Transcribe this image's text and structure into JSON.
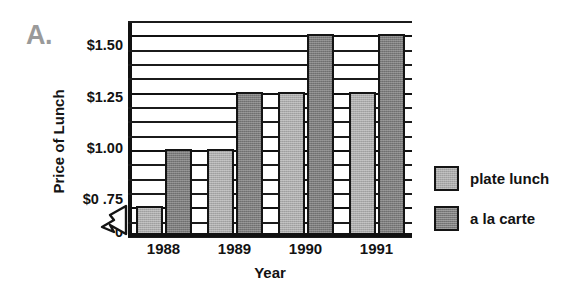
{
  "panel": {
    "letter": "A."
  },
  "chart_data": {
    "type": "bar",
    "title": "",
    "xlabel": "Year",
    "ylabel": "Price of Lunch",
    "categories": [
      "1988",
      "1989",
      "1990",
      "1991"
    ],
    "series": [
      {
        "name": "plate lunch",
        "color": "#ababab",
        "values": [
          0.75,
          1.0,
          1.25,
          1.25
        ]
      },
      {
        "name": "a la carte",
        "color": "#7c7c7c",
        "values": [
          1.0,
          1.25,
          1.5,
          1.5
        ]
      }
    ],
    "ytick_labels": [
      "$1.50",
      "$1.25",
      "$1.00",
      "$0 .75",
      "0"
    ],
    "ytick_values": [
      1.5,
      1.25,
      1.0,
      0.75,
      0
    ],
    "ylim": [
      0.625,
      1.5625
    ],
    "grid": true,
    "axis_break": true,
    "legend_position": "right"
  },
  "legend": {
    "items": [
      {
        "label": "plate lunch"
      },
      {
        "label": "a la carte"
      }
    ]
  }
}
